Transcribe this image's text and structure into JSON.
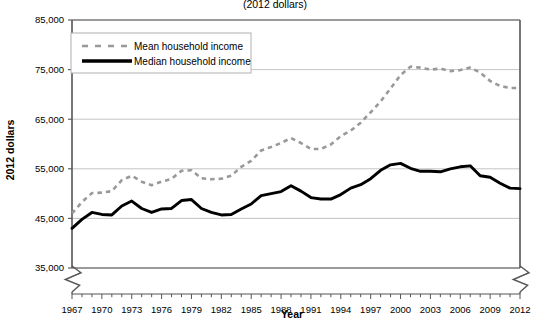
{
  "chart_data": {
    "type": "line",
    "title": "(2012 dollars)",
    "xlabel": "Year",
    "ylabel": "2012 dollars",
    "ylim": [
      35000,
      85000
    ],
    "xlim": [
      1967,
      2012
    ],
    "yticks": [
      "35,000",
      "45,000",
      "55,000",
      "65,000",
      "75,000",
      "85,000"
    ],
    "ytick_values": [
      35000,
      45000,
      55000,
      65000,
      75000,
      85000
    ],
    "xticks": [
      "1967",
      "1970",
      "1973",
      "1976",
      "1979",
      "1982",
      "1985",
      "1988",
      "1991",
      "1994",
      "1997",
      "2000",
      "2003",
      "2006",
      "2009",
      "2012"
    ],
    "xtick_values": [
      1967,
      1970,
      1973,
      1976,
      1979,
      1982,
      1985,
      1988,
      1991,
      1994,
      1997,
      2000,
      2003,
      2006,
      2009,
      2012
    ],
    "grid": true,
    "legend_position": "upper-left",
    "axis_break": "y-axis-zigzag-break-at-bottom",
    "x": [
      1967,
      1968,
      1969,
      1970,
      1971,
      1972,
      1973,
      1974,
      1975,
      1976,
      1977,
      1978,
      1979,
      1980,
      1981,
      1982,
      1983,
      1984,
      1985,
      1986,
      1987,
      1988,
      1989,
      1990,
      1991,
      1992,
      1993,
      1994,
      1995,
      1996,
      1997,
      1998,
      1999,
      2000,
      2001,
      2002,
      2003,
      2004,
      2005,
      2006,
      2007,
      2008,
      2009,
      2010,
      2011,
      2012
    ],
    "series": [
      {
        "name": "Mean household income",
        "style": "dashed",
        "color": "#999999",
        "values": [
          46000,
          48300,
          50100,
          50200,
          50500,
          52700,
          53600,
          52400,
          51700,
          52400,
          53000,
          54600,
          54700,
          53100,
          52900,
          53000,
          53600,
          55400,
          56600,
          58700,
          59400,
          60200,
          61200,
          60200,
          59000,
          59000,
          59900,
          61600,
          62700,
          64300,
          66400,
          68600,
          71200,
          73900,
          75600,
          75400,
          75000,
          75200,
          74700,
          74900,
          75400,
          74400,
          72700,
          71700,
          71300,
          71300
        ]
      },
      {
        "name": "Median household income",
        "style": "solid",
        "color": "#000000",
        "values": [
          43000,
          44800,
          46200,
          45800,
          45700,
          47500,
          48500,
          47000,
          46200,
          46900,
          47000,
          48600,
          48800,
          47000,
          46200,
          45700,
          45800,
          46900,
          47900,
          49600,
          50000,
          50400,
          51600,
          50500,
          49200,
          48900,
          48900,
          49800,
          51100,
          51800,
          53000,
          54700,
          55800,
          56100,
          55100,
          54500,
          54500,
          54400,
          55000,
          55400,
          55600,
          53600,
          53300,
          52100,
          51100,
          51000
        ]
      }
    ]
  }
}
